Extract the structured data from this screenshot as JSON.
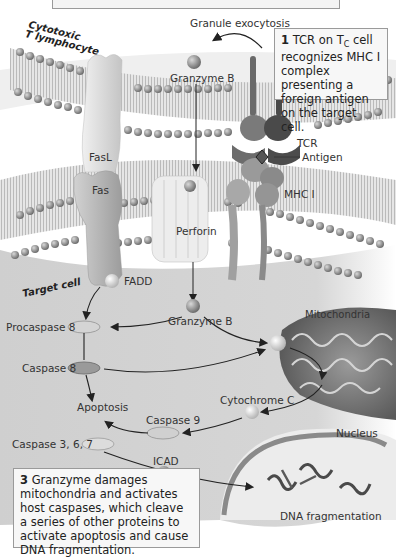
{
  "figure": {
    "colors": {
      "background": "#ffffff",
      "cytoplasm": "#d4d4d4",
      "membrane_head": "#8a8a8a",
      "protein_light": "#dcdcdc",
      "protein_mid": "#9a9a9a",
      "protein_dark": "#555555",
      "callout_bg": "#f7f7f7",
      "callout_border": "#9a9a9a",
      "text": "#333333"
    }
  },
  "cells": {
    "effector_label": "Cytotoxic T lymphocyte",
    "effector_line1": "Cytotoxic",
    "effector_line2": "T lymphocyte",
    "target_label": "Target cell"
  },
  "labels": {
    "granule_exocytosis": "Granule exocytosis",
    "granzyme_b_top": "Granzyme B",
    "fasl": "FasL",
    "fas": "Fas",
    "fadd": "FADD",
    "perforin": "Perforin",
    "tcr": "TCR",
    "antigen": "Antigen",
    "mhc1": "MHC I",
    "granzyme_b_bottom": "Granzyme B",
    "mitochondria": "Mitochondria",
    "procaspase8": "Procaspase 8",
    "caspase8": "Caspase 8",
    "apoptosis": "Apoptosis",
    "cytochrome_c": "Cytochrome C",
    "caspase9": "Caspase 9",
    "caspase367": "Caspase 3, 6, 7",
    "icad": "ICAD",
    "nucleus": "Nucleus",
    "dna_fragmentation": "DNA fragmentation"
  },
  "callouts": {
    "step1": {
      "number": "1",
      "text_a": "TCR on T",
      "subscript": "C",
      "text_b": " cell recognizes MHC I complex presenting a foreign antigen on the target cell."
    },
    "step3": {
      "number": "3",
      "text": "Granzyme damages mitochondria and activates host caspases, which cleave a series of other proteins to activate apoptosis and cause DNA fragmentation."
    }
  }
}
